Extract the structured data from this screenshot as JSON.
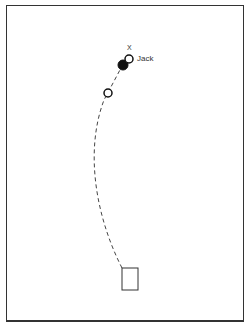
{
  "diagram": {
    "type": "bowls-trajectory",
    "labels": {
      "jack": "Jack",
      "target_marker": "X"
    },
    "elements": [
      {
        "name": "mat",
        "shape": "rectangle",
        "x": 122,
        "y": 268,
        "w": 16,
        "h": 22
      },
      {
        "name": "bowl-open-lower",
        "shape": "circle-open",
        "cx": 108,
        "cy": 93,
        "r": 4
      },
      {
        "name": "bowl-filled",
        "shape": "circle-filled",
        "cx": 123,
        "cy": 65,
        "r": 5
      },
      {
        "name": "jack",
        "shape": "circle-open",
        "cx": 129,
        "cy": 59,
        "r": 4
      }
    ],
    "path": {
      "style": "dashed",
      "from": "mat",
      "to": "bowl-filled"
    }
  }
}
